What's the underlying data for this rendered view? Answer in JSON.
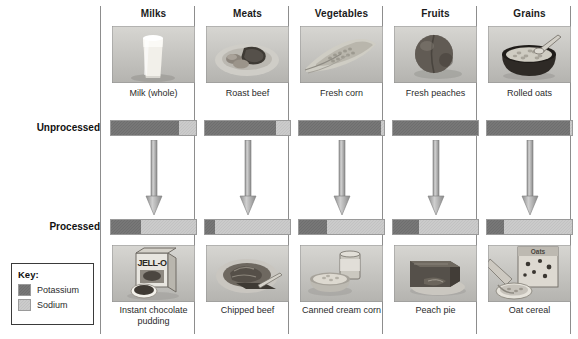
{
  "figure": {
    "row_labels": {
      "unprocessed": "Unprocessed",
      "processed": "Processed"
    },
    "key": {
      "title": "Key:",
      "items": [
        {
          "label": "Potassium",
          "color": "#6e6e6e",
          "swatch": "potassium"
        },
        {
          "label": "Sodium",
          "color": "#c2c2c2",
          "swatch": "sodium"
        }
      ]
    },
    "credit": "Photos: Matthew Farruggio (all), art: © Cengage Learning 2013"
  },
  "chart_data": {
    "type": "bar",
    "title": "",
    "xlabel": "",
    "ylabel": "",
    "orientation": "horizontal-stacked",
    "unit": "percent of combined potassium + sodium",
    "legend": [
      "Potassium",
      "Sodium"
    ],
    "legend_position": "lower-left",
    "rows": [
      "Unprocessed",
      "Processed"
    ],
    "categories": [
      "Milks",
      "Meats",
      "Vegetables",
      "Fruits",
      "Grains"
    ],
    "series": [
      {
        "name": "Potassium",
        "color": "#6e6e6e",
        "unprocessed": [
          80,
          84,
          96,
          100,
          98
        ],
        "processed": [
          35,
          12,
          33,
          30,
          20
        ]
      },
      {
        "name": "Sodium",
        "color": "#c2c2c2",
        "unprocessed": [
          20,
          16,
          4,
          0,
          2
        ],
        "processed": [
          65,
          88,
          67,
          70,
          80
        ]
      }
    ]
  },
  "columns": [
    {
      "header": "Milks",
      "unprocessed": {
        "caption": "Milk (whole)",
        "photo_name": "glass-of-milk-photo",
        "potassium_pct": 80,
        "sodium_pct": 20
      },
      "processed": {
        "caption": "Instant chocolate pudding",
        "photo_name": "jello-pudding-box-photo",
        "potassium_pct": 35,
        "sodium_pct": 65
      }
    },
    {
      "header": "Meats",
      "unprocessed": {
        "caption": "Roast beef",
        "photo_name": "roast-beef-plate-photo",
        "potassium_pct": 84,
        "sodium_pct": 16
      },
      "processed": {
        "caption": "Chipped beef",
        "photo_name": "chipped-beef-plate-photo",
        "potassium_pct": 12,
        "sodium_pct": 88
      }
    },
    {
      "header": "Vegetables",
      "unprocessed": {
        "caption": "Fresh corn",
        "photo_name": "fresh-corn-cob-photo",
        "potassium_pct": 96,
        "sodium_pct": 4
      },
      "processed": {
        "caption": "Canned cream corn",
        "photo_name": "canned-cream-corn-photo",
        "potassium_pct": 33,
        "sodium_pct": 67
      }
    },
    {
      "header": "Fruits",
      "unprocessed": {
        "caption": "Fresh peaches",
        "photo_name": "fresh-peach-photo",
        "potassium_pct": 100,
        "sodium_pct": 0
      },
      "processed": {
        "caption": "Peach pie",
        "photo_name": "peach-pie-slice-photo",
        "potassium_pct": 30,
        "sodium_pct": 70
      }
    },
    {
      "header": "Grains",
      "unprocessed": {
        "caption": "Rolled oats",
        "photo_name": "bowl-of-rolled-oats-photo",
        "potassium_pct": 98,
        "sodium_pct": 2
      },
      "processed": {
        "caption": "Oat cereal",
        "photo_name": "oat-cereal-box-photo",
        "potassium_pct": 20,
        "sodium_pct": 80
      }
    }
  ]
}
